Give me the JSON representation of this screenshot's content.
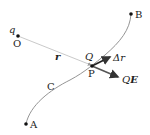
{
  "diagram": {
    "points": {
      "O": {
        "label": "O",
        "charge_label": "q"
      },
      "A": {
        "label": "A"
      },
      "B": {
        "label": "B"
      },
      "P": {
        "label": "P",
        "charge_label": "Q"
      }
    },
    "curve_label": "C",
    "radius_label": "r",
    "displacement_label": "Δr",
    "force_label_prefix": "Q",
    "force_label_vector": "E",
    "colors": {
      "line": "#bbbbbb",
      "curve": "#888888",
      "arrow": "#333333",
      "point": "#111111"
    }
  }
}
